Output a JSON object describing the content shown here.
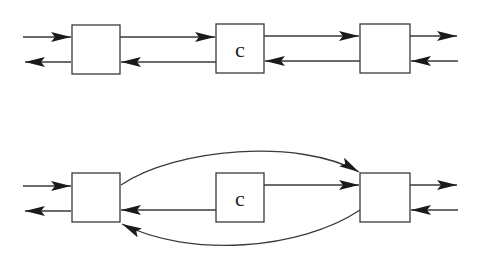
{
  "diagrams": [
    {
      "id": "top",
      "description": "Linear chain: left node, node c, right node with bidirectional links",
      "nodes": [
        {
          "id": "left",
          "label": ""
        },
        {
          "id": "c",
          "label": "c"
        },
        {
          "id": "right",
          "label": ""
        }
      ],
      "edges": [
        {
          "from": "external-in-left",
          "to": "left"
        },
        {
          "from": "left",
          "to": "external-out-left"
        },
        {
          "from": "left",
          "to": "c"
        },
        {
          "from": "c",
          "to": "left"
        },
        {
          "from": "c",
          "to": "right"
        },
        {
          "from": "right",
          "to": "c"
        },
        {
          "from": "right",
          "to": "external-out-right"
        },
        {
          "from": "external-in-right",
          "to": "right"
        }
      ]
    },
    {
      "id": "bottom",
      "description": "Node c bypassed: left and right nodes linked directly via curved arcs; c sends to both",
      "nodes": [
        {
          "id": "left",
          "label": ""
        },
        {
          "id": "c",
          "label": "c"
        },
        {
          "id": "right",
          "label": ""
        }
      ],
      "edges": [
        {
          "from": "external-in-left",
          "to": "left"
        },
        {
          "from": "left",
          "to": "external-out-left"
        },
        {
          "from": "left",
          "to": "right",
          "curve": "upper-arc"
        },
        {
          "from": "right",
          "to": "left",
          "curve": "lower-arc"
        },
        {
          "from": "c",
          "to": "right"
        },
        {
          "from": "c",
          "to": "left"
        },
        {
          "from": "right",
          "to": "external-out-right"
        },
        {
          "from": "external-in-right",
          "to": "right"
        }
      ]
    }
  ],
  "labels": {
    "top_c": "c",
    "bottom_c": "c"
  },
  "colors": {
    "stroke": "#3a3a3a",
    "arrowhead": "#1a1a1a",
    "background": "#ffffff"
  }
}
